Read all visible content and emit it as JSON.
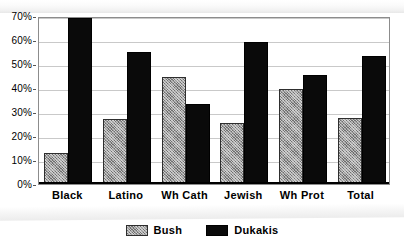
{
  "chart_data": {
    "type": "bar",
    "title": "",
    "subtitle": "",
    "xlabel": "",
    "ylabel": "",
    "ylim": [
      0,
      70
    ],
    "grid": true,
    "legend_position": "bottom-center",
    "y_ticks": [
      "0%",
      "10%",
      "20%",
      "30%",
      "40%",
      "50%",
      "60%",
      "70%"
    ],
    "y_tick_values": [
      0,
      10,
      20,
      30,
      40,
      50,
      60,
      70
    ],
    "categories": [
      "Black",
      "Latino",
      "Wh Cath",
      "Jewish",
      "Wh Prot",
      "Total"
    ],
    "series": [
      {
        "name": "Bush",
        "color": "#9a9a9a",
        "pattern": "cross-hatch",
        "values": [
          13,
          27,
          44.5,
          25.5,
          39.5,
          27.5
        ]
      },
      {
        "name": "Dukakis",
        "color": "#0a0a0a",
        "pattern": "solid",
        "values": [
          69,
          55,
          33.5,
          59,
          45.5,
          53.5
        ]
      }
    ]
  },
  "legend": {
    "items": [
      {
        "label": "Bush",
        "swatch": "bush-swatch"
      },
      {
        "label": "Dukakis",
        "swatch": "dukakis-swatch"
      }
    ]
  },
  "colors": {
    "bush": "#9a9a9a",
    "dukakis": "#0a0a0a",
    "gridline": "#c9c9c9",
    "frame": "#8c8c8c",
    "axis": "#000000",
    "background": "#ffffff"
  }
}
